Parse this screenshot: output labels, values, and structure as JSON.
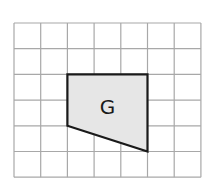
{
  "diagram": {
    "type": "grid-shape",
    "grid": {
      "columns": 7,
      "rows": 6,
      "origin_px": [
        14,
        23
      ],
      "cell_w_px": 26.7,
      "cell_h_px": 25.7,
      "line_color": "#a8a8a8"
    },
    "shape": {
      "label": "G",
      "fill_color": "#e6e6e6",
      "stroke_color": "#1a1a1a",
      "vertices_grid": [
        [
          2,
          2
        ],
        [
          5,
          2
        ],
        [
          5,
          5
        ],
        [
          2,
          4
        ]
      ]
    }
  }
}
